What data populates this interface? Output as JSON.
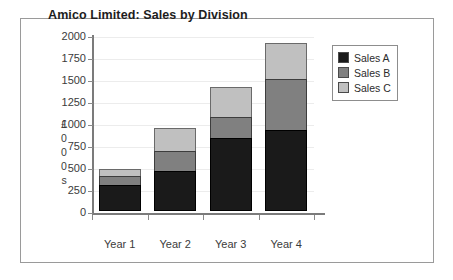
{
  "chart_data": {
    "type": "bar",
    "title": "Amico Limited: Sales by Division",
    "xlabel": "",
    "ylabel": "£000s",
    "ylabel_chars": [
      "£",
      "0",
      "0",
      "0",
      "s"
    ],
    "categories": [
      "Year 1",
      "Year 2",
      "Year 3",
      "Year 4"
    ],
    "series": [
      {
        "name": "Sales A",
        "color": "#1a1a1a",
        "values": [
          295,
          455,
          830,
          920
        ]
      },
      {
        "name": "Sales B",
        "color": "#808080",
        "values": [
          110,
          240,
          250,
          590
        ]
      },
      {
        "name": "Sales C",
        "color": "#c0c0c0",
        "values": [
          95,
          270,
          350,
          420
        ]
      }
    ],
    "totals": [
      500,
      965,
      1430,
      1930
    ],
    "stacked": true,
    "ylim": [
      0,
      2000
    ],
    "ytick_labels": [
      "2000",
      "1750",
      "1500",
      "1250",
      "1000",
      "750",
      "500",
      "250",
      "0"
    ],
    "ytick_values": [
      2000,
      1750,
      1500,
      1250,
      1000,
      750,
      500,
      250,
      0
    ],
    "grid": true,
    "legend_position": "top-right"
  },
  "legend": {
    "entries": [
      {
        "label": "Sales A",
        "color": "#1a1a1a"
      },
      {
        "label": "Sales B",
        "color": "#808080"
      },
      {
        "label": "Sales C",
        "color": "#c0c0c0"
      }
    ]
  }
}
